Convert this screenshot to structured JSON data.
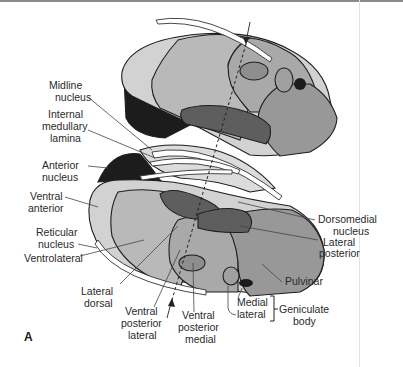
{
  "figure": {
    "panel_label": "A",
    "colors": {
      "light": "#d2d2d2",
      "mid_light": "#b9b9b9",
      "mid": "#a3a3a3",
      "mid_dark": "#8e8e8e",
      "dark": "#5e5e5e",
      "black": "#1c1c1c",
      "white_band": "#ffffff"
    },
    "labels": {
      "midline_1": "Midline",
      "midline_2": "nucleus",
      "iml_1": "Internal",
      "iml_2": "medullary",
      "iml_3": "lamina",
      "anterior_1": "Anterior",
      "anterior_2": "nucleus",
      "va_1": "Ventral",
      "va_2": "anterior",
      "reticular_1": "Reticular",
      "reticular_2": "nucleus",
      "vl": "Ventrolateral",
      "ld_1": "Lateral",
      "ld_2": "dorsal",
      "vpl_1": "Ventral",
      "vpl_2": "posterior",
      "vpl_3": "lateral",
      "vpm_1": "Ventral",
      "vpm_2": "posterior",
      "vpm_3": "medial",
      "dm_1": "Dorsomedial",
      "dm_2": "nucleus",
      "lp_1": "Lateral",
      "lp_2": "posterior",
      "pulvinar": "Pulvinar",
      "medial": "Medial",
      "lateral": "lateral",
      "geniculate_1": "Geniculate",
      "geniculate_2": "body"
    }
  }
}
